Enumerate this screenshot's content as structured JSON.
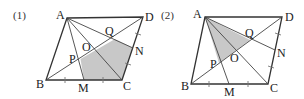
{
  "figures": [
    {
      "number_label": "(1)",
      "vertices": {
        "A": {
          "label": "A",
          "x": 67,
          "y": 18
        },
        "D": {
          "label": "D",
          "x": 143,
          "y": 17
        },
        "B": {
          "label": "B",
          "x": 46,
          "y": 80
        },
        "C": {
          "label": "C",
          "x": 122,
          "y": 80
        }
      },
      "points": {
        "M": {
          "label": "M"
        },
        "N": {
          "label": "N"
        },
        "O": {
          "label": "O"
        },
        "P": {
          "label": "P"
        },
        "Q": {
          "label": "Q"
        }
      },
      "shaded_region": "pentagon PMCNQ",
      "shade_color": "#c8c8c8"
    },
    {
      "number_label": "(2)",
      "vertices": {
        "A": {
          "label": "A",
          "x": 205,
          "y": 17
        },
        "D": {
          "label": "D",
          "x": 282,
          "y": 17
        },
        "B": {
          "label": "B",
          "x": 191,
          "y": 84
        },
        "C": {
          "label": "C",
          "x": 268,
          "y": 84
        }
      },
      "points": {
        "M": {
          "label": "M"
        },
        "N": {
          "label": "N"
        },
        "O": {
          "label": "O"
        },
        "P": {
          "label": "P"
        },
        "Q": {
          "label": "Q"
        }
      },
      "shaded_region": "triangle APQ",
      "shade_color": "#c8c8c8"
    }
  ]
}
